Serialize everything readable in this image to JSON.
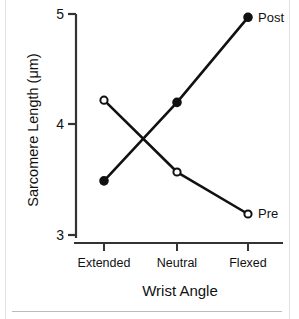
{
  "chart_data": {
    "type": "line",
    "title": "",
    "xlabel": "Wrist Angle",
    "ylabel": "Sarcomere Length (μm)",
    "categories": [
      "Extended",
      "Neutral",
      "Flexed"
    ],
    "ylim": [
      3,
      5
    ],
    "yticks": [
      3,
      4,
      5
    ],
    "ytick_labels": [
      "3",
      "4",
      "5"
    ],
    "grid": false,
    "legend_position": "inline-right-of-last-point",
    "series": [
      {
        "name": "Pre",
        "marker": "open-circle",
        "values": [
          4.22,
          3.57,
          3.19
        ],
        "color": "#111111"
      },
      {
        "name": "Post",
        "marker": "filled-circle",
        "values": [
          3.49,
          4.2,
          4.97
        ],
        "color": "#111111"
      }
    ]
  },
  "axes": {
    "y_tick_labels": [
      "5",
      "4",
      "3"
    ],
    "x_tick_labels": [
      "Extended",
      "Neutral",
      "Flexed"
    ],
    "y_axis_title": "Sarcomere Length (μm)",
    "x_axis_title": "Wrist Angle"
  },
  "labels": {
    "post": "Post",
    "pre": "Pre"
  },
  "colors": {
    "line": "#111111",
    "axis": "#333333",
    "background": "#ffffff",
    "frame": "#e2e2e2",
    "rule": "#bcbcbc"
  }
}
